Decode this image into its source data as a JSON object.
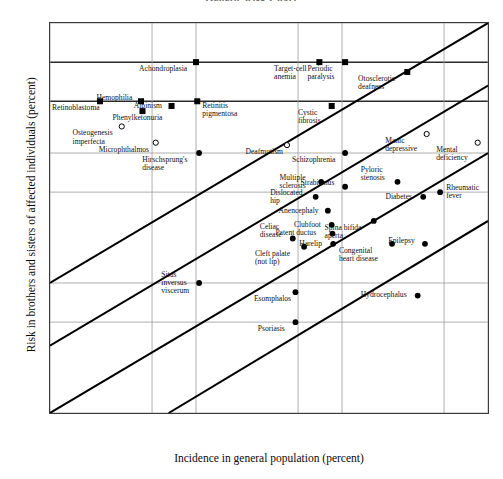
{
  "chart_data": {
    "type": "scatter",
    "title": "Genetic Risk Chart",
    "xlabel": "Incidence in general population (percent)",
    "ylabel": "Risk in brothers and sisters of affected individuals (percent)",
    "xscale": "log",
    "yscale": "log",
    "xlim": [
      0.001,
      1
    ],
    "ylim": [
      0.1,
      100
    ],
    "xticks": [
      "0.001",
      "0.005",
      "0.01",
      "0.05",
      "0.1",
      "0.5",
      "1"
    ],
    "xtick_values": [
      0.001,
      0.005,
      0.01,
      0.05,
      0.1,
      0.5,
      1
    ],
    "yticks": [
      "100",
      "50",
      "25",
      "10",
      "5",
      "1",
      "0.5",
      "0.1"
    ],
    "ytick_values": [
      100,
      50,
      25,
      10,
      5,
      1,
      0.5,
      0.1
    ],
    "grid": true,
    "legend": "none",
    "reference_bands": [
      {
        "name": "Simple dominant",
        "y": 50,
        "label": "Simple dominant"
      },
      {
        "name": "Simple recessive",
        "y": 25,
        "label": "Simple recessive"
      }
    ],
    "heritability_lines": [
      {
        "label": "h² = 1.00",
        "x1": 0.001,
        "y1": 1.0,
        "x2": 1,
        "y2": 100
      },
      {
        "label": "h² = 0.80",
        "x1": 0.001,
        "y1": 0.33,
        "x2": 1,
        "y2": 33
      },
      {
        "label": "h² = 0.60",
        "x1": 0.001,
        "y1": 0.1,
        "x2": 1,
        "y2": 10
      },
      {
        "label": "h² = 0.40",
        "x1": 0.0065,
        "y1": 0.1,
        "x2": 1,
        "y2": 3.0
      }
    ],
    "marker_types": {
      "filled_square": "Mendelian / single-gene condition",
      "filled_circle": "Multifactorial condition",
      "open_circle": "Uncertain / heterogeneous condition"
    },
    "points": [
      {
        "label": "Achondroplasia",
        "x": 0.01,
        "y": 50,
        "marker": "filled_square",
        "label_pos": "below-left"
      },
      {
        "label": "Target-cell anemia",
        "x": 0.07,
        "y": 50,
        "marker": "filled_square",
        "label_pos": "below-left"
      },
      {
        "label": "Periodic paralysis",
        "x": 0.105,
        "y": 50,
        "marker": "filled_square",
        "label_pos": "below-left"
      },
      {
        "label": "Otosclerotic deafness",
        "x": 0.28,
        "y": 42,
        "marker": "filled_square",
        "label_pos": "below-left"
      },
      {
        "label": "Retinoblastoma",
        "x": 0.0022,
        "y": 25,
        "marker": "filled_square",
        "label_pos": "below-left"
      },
      {
        "label": "Hemophilia",
        "x": 0.0042,
        "y": 25,
        "marker": "filled_square",
        "label_pos": "above-left"
      },
      {
        "label": "Albinism",
        "x": 0.0068,
        "y": 23,
        "marker": "filled_square",
        "label_pos": "left"
      },
      {
        "label": "Phenylketonuria",
        "x": 0.0043,
        "y": 21,
        "marker": "filled_square",
        "label_pos": "below"
      },
      {
        "label": "Retinitis pigmentosa",
        "x": 0.0102,
        "y": 25,
        "marker": "filled_square",
        "label_pos": "below-right"
      },
      {
        "label": "Cystic fibrosis",
        "x": 0.085,
        "y": 23,
        "marker": "filled_square",
        "label_pos": "below-left"
      },
      {
        "label": "Osteogenesis imperfecta",
        "x": 0.0031,
        "y": 16,
        "marker": "open_circle",
        "label_pos": "below-left"
      },
      {
        "label": "Microphthalmos",
        "x": 0.0053,
        "y": 12,
        "marker": "open_circle",
        "label_pos": "below-left"
      },
      {
        "label": "Hirschsprung's disease",
        "x": 0.0105,
        "y": 10,
        "marker": "filled_circle",
        "label_pos": "below-left"
      },
      {
        "label": "Deafmutism",
        "x": 0.042,
        "y": 11.5,
        "marker": "open_circle",
        "label_pos": "below-left"
      },
      {
        "label": "Manic depressive",
        "x": 0.38,
        "y": 14,
        "marker": "open_circle",
        "label_pos": "below-left"
      },
      {
        "label": "Mental deficiency",
        "x": 0.85,
        "y": 12,
        "marker": "open_circle",
        "label_pos": "below-left"
      },
      {
        "label": "Schizophrenia",
        "x": 0.105,
        "y": 10,
        "marker": "filled_circle",
        "label_pos": "below-left"
      },
      {
        "label": "Multiple sclerosis",
        "x": 0.072,
        "y": 6.0,
        "marker": "filled_circle",
        "label_pos": "left"
      },
      {
        "label": "Strabismus",
        "x": 0.105,
        "y": 5.5,
        "marker": "filled_circle",
        "label_pos": "above-left"
      },
      {
        "label": "Pyloric stenosis",
        "x": 0.24,
        "y": 6.0,
        "marker": "filled_circle",
        "label_pos": "above-left"
      },
      {
        "label": "Rheumatic fever",
        "x": 0.47,
        "y": 5.0,
        "marker": "filled_circle",
        "label_pos": "right"
      },
      {
        "label": "Dislocated hip",
        "x": 0.066,
        "y": 4.6,
        "marker": "filled_circle",
        "label_pos": "left"
      },
      {
        "label": "Anencephaly",
        "x": 0.08,
        "y": 3.6,
        "marker": "filled_circle",
        "label_pos": "left"
      },
      {
        "label": "Diabetes",
        "x": 0.36,
        "y": 4.6,
        "marker": "filled_circle",
        "label_pos": "left"
      },
      {
        "label": "Clubfoot",
        "x": 0.085,
        "y": 2.8,
        "marker": "filled_circle",
        "label_pos": "left"
      },
      {
        "label": "Patent ductus",
        "x": 0.086,
        "y": 2.4,
        "marker": "filled_circle",
        "label_pos": "left"
      },
      {
        "label": "Harelip",
        "x": 0.087,
        "y": 2.0,
        "marker": "filled_circle",
        "label_pos": "left"
      },
      {
        "label": "Spina bifida aperta",
        "x": 0.165,
        "y": 3.0,
        "marker": "filled_circle",
        "label_pos": "below-left"
      },
      {
        "label": "Celiac disease",
        "x": 0.046,
        "y": 2.2,
        "marker": "filled_circle",
        "label_pos": "above-left"
      },
      {
        "label": "Cleft palate (not lip)",
        "x": 0.055,
        "y": 1.9,
        "marker": "filled_circle",
        "label_pos": "below-left"
      },
      {
        "label": "Congenital heart disease",
        "x": 0.22,
        "y": 2.0,
        "marker": "filled_circle",
        "label_pos": "below-left"
      },
      {
        "label": "Epilepsy",
        "x": 0.37,
        "y": 2.0,
        "marker": "filled_circle",
        "label_pos": "above-left"
      },
      {
        "label": "Situs inversus viscerum",
        "x": 0.0105,
        "y": 1.0,
        "marker": "filled_circle",
        "label_pos": "left"
      },
      {
        "label": "Esomphalos",
        "x": 0.048,
        "y": 0.85,
        "marker": "filled_circle",
        "label_pos": "below-left"
      },
      {
        "label": "Hydrocephalus",
        "x": 0.33,
        "y": 0.8,
        "marker": "filled_circle",
        "label_pos": "left"
      },
      {
        "label": "Psoriasis",
        "x": 0.048,
        "y": 0.5,
        "marker": "filled_circle",
        "label_pos": "below-left"
      }
    ]
  }
}
